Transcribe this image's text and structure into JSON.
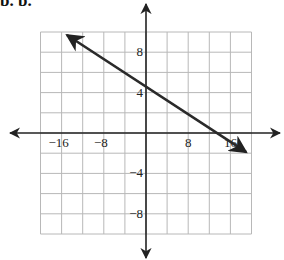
{
  "header": {
    "label": "b. b."
  },
  "chart_data": {
    "type": "line",
    "title": "",
    "xlabel": "",
    "ylabel": "",
    "xlim": [
      -20,
      20
    ],
    "ylim": [
      -10,
      10
    ],
    "grid": true,
    "x_grid_step": 4,
    "y_grid_step": 2,
    "x_tick_labels": [
      "-16",
      "-8",
      "8",
      "16"
    ],
    "x_tick_values": [
      -16,
      -8,
      8,
      16
    ],
    "y_tick_labels": [
      "8",
      "4",
      "-4",
      "-8"
    ],
    "y_tick_values": [
      8,
      4,
      -4,
      -8
    ],
    "series": [
      {
        "name": "line",
        "description": "Line through (0, 5) and (16, 0), arrows at both ends",
        "x": [
          -15,
          0,
          16,
          19
        ],
        "y": [
          9.7,
          5,
          0,
          -1.9
        ]
      }
    ]
  }
}
